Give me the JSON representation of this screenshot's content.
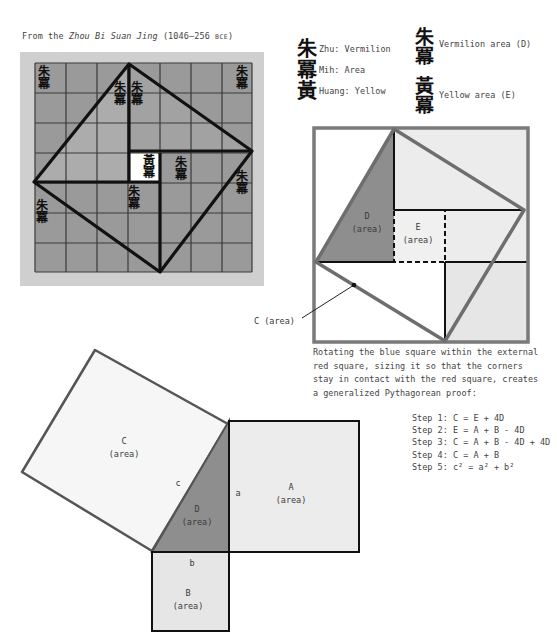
{
  "caption": {
    "prefix": "From the ",
    "title": "Zhou Bi Suan Jing",
    "dates": " (1046–256 ",
    "era": "BCE",
    "suffix": ")"
  },
  "legend_left": [
    {
      "glyph": "朱",
      "text": "Zhu: Vermilion"
    },
    {
      "glyph": "冪",
      "text": "Mih: Area"
    },
    {
      "glyph": "黃",
      "text": "Huang: Yellow"
    }
  ],
  "legend_right": [
    {
      "glyphs": [
        "朱",
        "冪"
      ],
      "text": "Vermilion area (D)"
    },
    {
      "glyphs": [
        "黃",
        "冪"
      ],
      "text": "Yellow area (E)"
    }
  ],
  "ancient_grid": {
    "cells": 7,
    "vermilion_glyph": "朱",
    "area_glyph": "冪",
    "yellow_glyph": "黃"
  },
  "rotated_square": {
    "label_D": "D",
    "label_E": "E",
    "area": "(area)",
    "callout": "C (area)"
  },
  "description": "Rotating the blue square within the external red square, sizing it so that the corners stay in contact with the red square, creates a generalized Pythagorean proof:",
  "steps": [
    "Step 1: C = E + 4D",
    "Step 2: E = A + B - 4D",
    "Step 3: C = A + B - 4D + 4D",
    "Step 4: C = A + B",
    "Step 5: c² = a² + b²"
  ],
  "pythagoras": {
    "C": "C",
    "A": "A",
    "B": "B",
    "D": "D",
    "area": "(area)",
    "side_a": "a",
    "side_b": "b",
    "side_c": "c"
  },
  "colors": {
    "grid_bg": "#cfcfcf",
    "grid_cell": "#9a9a9a",
    "grid_line": "#333333",
    "frame_line": "#7a7a7a",
    "dark_fill": "#8e8e8e",
    "light_fill": "#ececec",
    "square_C_fill": "#f6f6f6"
  }
}
